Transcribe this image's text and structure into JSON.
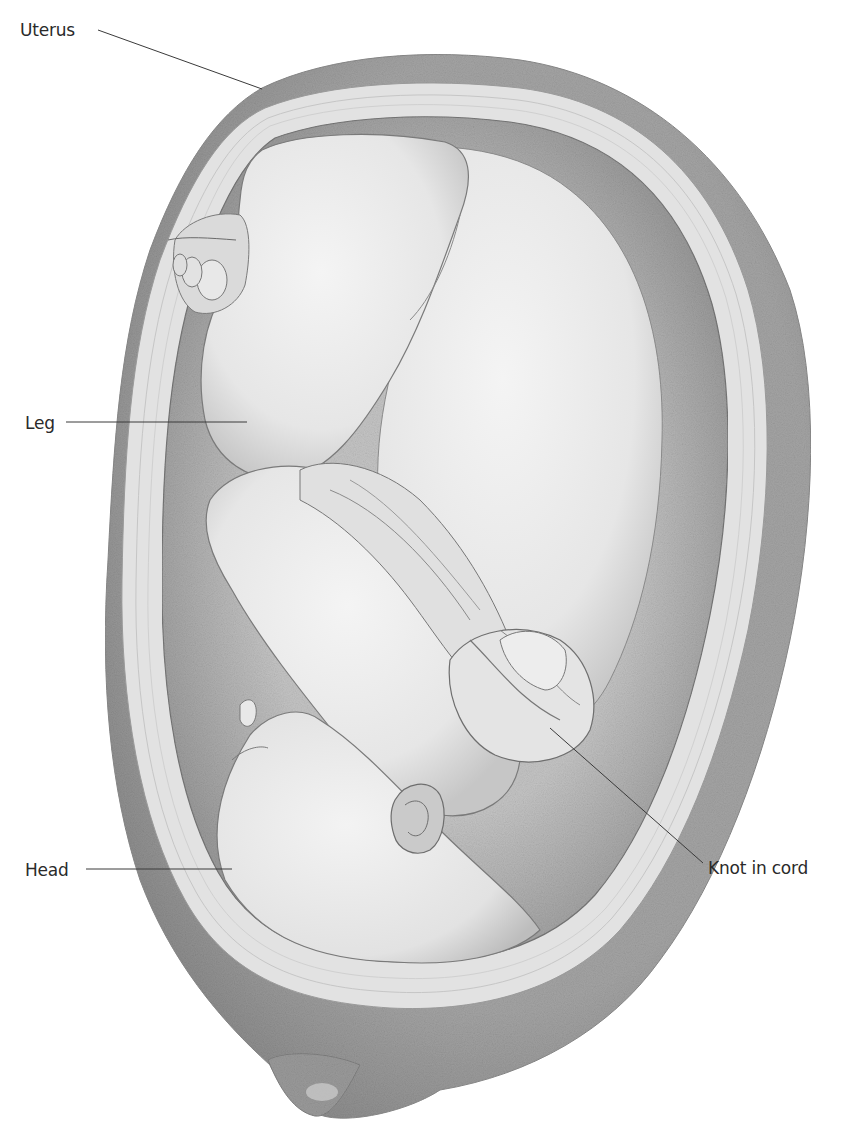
{
  "figure": {
    "colors": {
      "background": "#ffffff",
      "uterus_wall": "#9c9c9c",
      "uterus_wall_dark": "#8a8a8a",
      "membrane_band": "#e4e4e4",
      "cavity_shadow": "#a8a8a8",
      "fetus_skin": "#ececec",
      "fetus_shade": "#cfcfcf",
      "outline": "#6e6e6e",
      "label_text": "#2a2a2a",
      "leader_line": "#3a3a3a"
    }
  },
  "labels": [
    {
      "id": "uterus",
      "text": "Uterus",
      "x": 20,
      "y": 20,
      "line": {
        "x1": 98,
        "y1": 30,
        "x2": 262,
        "y2": 89
      }
    },
    {
      "id": "leg",
      "text": "Leg",
      "x": 25,
      "y": 413,
      "line": {
        "x1": 66,
        "y1": 422,
        "x2": 247,
        "y2": 422
      }
    },
    {
      "id": "head",
      "text": "Head",
      "x": 25,
      "y": 860,
      "line": {
        "x1": 86,
        "y1": 869,
        "x2": 232,
        "y2": 869
      }
    },
    {
      "id": "knot-in-cord",
      "text": "Knot in cord",
      "x": 708,
      "y": 858,
      "line": {
        "x1": 550,
        "y1": 728,
        "x2": 703,
        "y2": 863
      }
    }
  ]
}
